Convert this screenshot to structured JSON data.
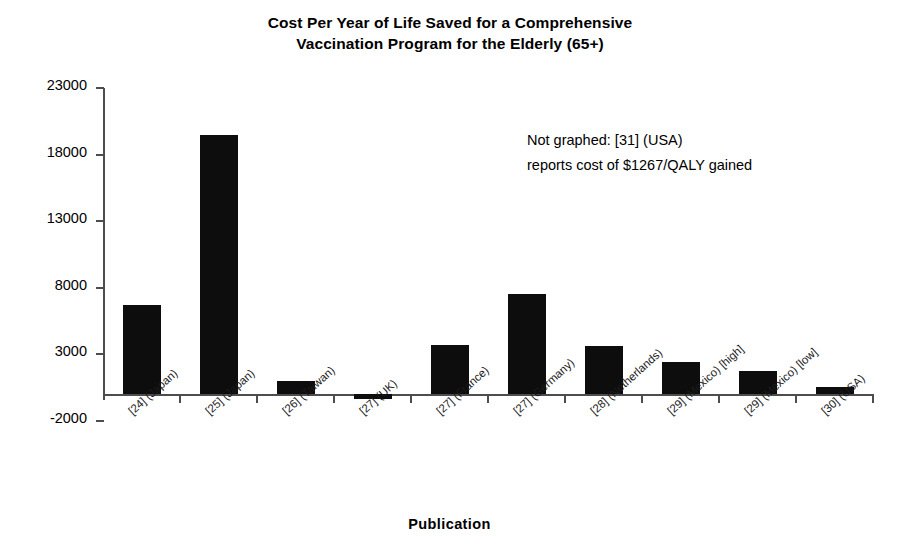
{
  "chart_data": {
    "type": "bar",
    "title": "Cost Per Year of Life Saved for a Comprehensive Vaccination Program for the Elderly (65+)",
    "title_lines": [
      "Cost Per Year of Life Saved for a Comprehensive",
      "Vaccination Program for the Elderly (65+)"
    ],
    "xlabel": "Publication",
    "ylabel": "",
    "ylim": [
      -2000,
      23000
    ],
    "ytick_labels": [
      "23000",
      "18000",
      "13000",
      "8000",
      "3000",
      "-2000"
    ],
    "yticks": [
      23000,
      18000,
      13000,
      8000,
      3000,
      -2000
    ],
    "grid": false,
    "legend": null,
    "categories": [
      "[24] (Japan)",
      "[25] (Japan)",
      "[26] (Taiwan)",
      "[27] (UK)",
      "[27] (France)",
      "[27] (Germany)",
      "[28] (Netherlands)",
      "[29] (Mexico) [high]",
      "[29] (Mexico) [low]",
      "[30] (USA)"
    ],
    "values": [
      6700,
      19500,
      1000,
      -400,
      3700,
      7500,
      3600,
      2400,
      1700,
      500
    ],
    "bar_color": "#0d0d0d",
    "annotation_lines": [
      "Not graphed: [31] (USA)",
      "reports cost of $1267/QALY gained"
    ]
  }
}
